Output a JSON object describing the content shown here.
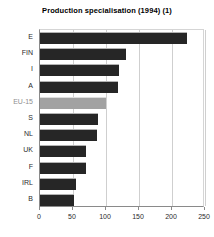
{
  "chart_data": {
    "type": "bar",
    "orientation": "horizontal",
    "title": "Production specialisation (1994) (1)",
    "xlabel": "",
    "ylabel": "",
    "categories": [
      "E",
      "FIN",
      "I",
      "A",
      "EU-15",
      "S",
      "NL",
      "UK",
      "F",
      "IRL",
      "B"
    ],
    "values": [
      223,
      130,
      119,
      118,
      100,
      88,
      87,
      70,
      69,
      55,
      52
    ],
    "xlim": [
      0,
      250
    ],
    "xticks": [
      0,
      50,
      100,
      150,
      200,
      250
    ],
    "xtick_labels": [
      "0",
      "50",
      "100",
      "150",
      "200",
      "250"
    ],
    "grid": "vertical",
    "legend": "none",
    "highlight_category": "EU-15",
    "colors": {
      "bar": "#262626",
      "highlight_bar": "#a2a2a2",
      "highlight_label": "#8e8e8e",
      "gridline": "#cfcfcf",
      "axis": "#8a8a8a",
      "text": "#2b2b2b",
      "title": "#000000",
      "background": "#ffffff"
    }
  }
}
